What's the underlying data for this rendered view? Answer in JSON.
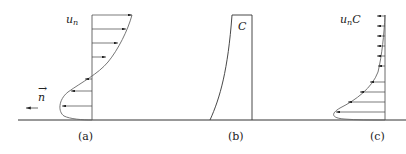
{
  "panels": [
    {
      "id": "a",
      "caption": "(a)",
      "variable": "u",
      "subscript": "n",
      "direction_label": "n",
      "direction_vector": "→"
    },
    {
      "id": "b",
      "caption": "(b)",
      "variable": "C"
    },
    {
      "id": "c",
      "caption": "(c)",
      "variable": "u",
      "subscript": "n",
      "suffix": "C"
    }
  ],
  "colors": {
    "line": "#333333",
    "curve": "#666666"
  }
}
